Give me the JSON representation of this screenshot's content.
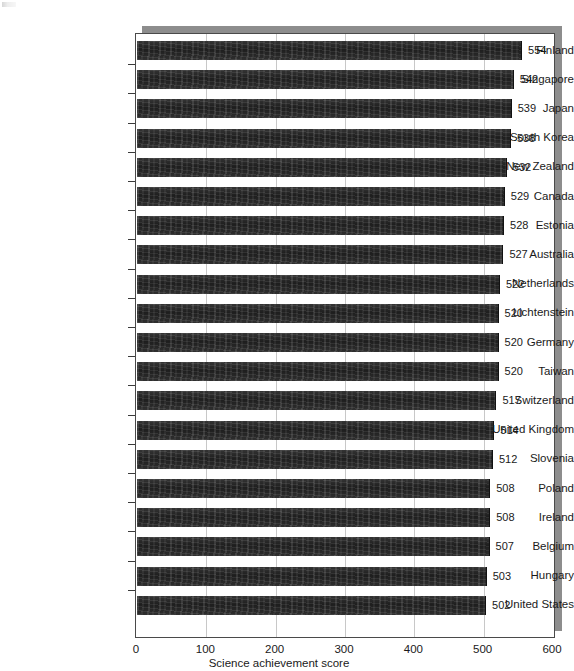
{
  "chart_data": {
    "type": "bar",
    "orientation": "horizontal",
    "title": "",
    "xlabel": "Science achievement score",
    "ylabel": "",
    "xlim": [
      0,
      600
    ],
    "xticks": [
      0,
      100,
      200,
      300,
      400,
      500,
      600
    ],
    "xtick_labels": [
      "0",
      "100",
      "200",
      "300",
      "400",
      "500",
      "600"
    ],
    "grid": "vertical",
    "legend": "none",
    "bar_color": "#2b2b2b",
    "value_labels": true,
    "categories": [
      "Finland",
      "Singapore",
      "Japan",
      "South Korea",
      "New Zealand",
      "Canada",
      "Estonia",
      "Australia",
      "Netherlands",
      "Lichtenstein",
      "Germany",
      "Taiwan",
      "Switzerland",
      "United Kingdom",
      "Slovenia",
      "Poland",
      "Ireland",
      "Belgium",
      "Hungary",
      "United States"
    ],
    "values": [
      554,
      542,
      539,
      538,
      532,
      529,
      528,
      527,
      522,
      520,
      520,
      520,
      517,
      514,
      512,
      508,
      508,
      507,
      503,
      502
    ]
  },
  "colors": {
    "bar": "#2b2b2b",
    "gridline": "#c8c8c8",
    "frame": "#4a4a4a",
    "shadow": "#8d8d8d",
    "text": "#1a1a1a",
    "background": "#ffffff"
  }
}
